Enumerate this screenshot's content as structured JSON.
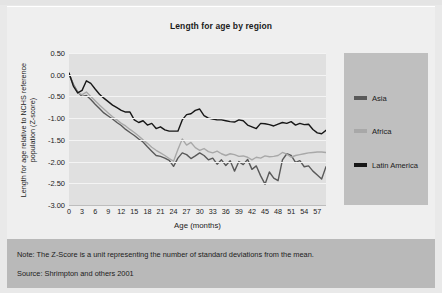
{
  "figure": {
    "title": "Length for age by region",
    "note": "Note: The Z-Score is a unit representing the number of standard deviations from the mean.",
    "source": "Source: Shrimpton and others 2001"
  },
  "colors": {
    "asia": "#595959",
    "africa": "#a8a8a8",
    "latin_america": "#171717",
    "plot_background": "#e0e0e0",
    "panel_background": "#efefef",
    "legend_background": "#bfbfbf",
    "footer_background": "#b9b9b9",
    "gridline": "#f4f4f4"
  },
  "legend": {
    "items": [
      {
        "label": "Asia",
        "color": "#595959"
      },
      {
        "label": "Africa",
        "color": "#a8a8a8"
      },
      {
        "label": "Latin America",
        "color": "#171717"
      }
    ]
  },
  "chart_data": {
    "type": "line",
    "title": "Length for age by region",
    "xlabel": "Age (months)",
    "ylabel": "Length for age relative to NCHS reference population (Z-score)",
    "xlim": [
      0,
      59
    ],
    "ylim": [
      -3.0,
      0.5
    ],
    "grid": true,
    "legend_position": "right",
    "xticks": [
      0,
      3,
      6,
      9,
      12,
      15,
      18,
      21,
      24,
      27,
      30,
      33,
      36,
      39,
      42,
      45,
      48,
      51,
      54,
      57
    ],
    "yticks": [
      0.5,
      0.0,
      -0.5,
      -1.0,
      -1.5,
      -2.0,
      -2.5,
      -3.0
    ],
    "ytick_labels": [
      "0.50",
      "0.00",
      "-0.50",
      "-1.00",
      "-1.50",
      "-2.00",
      "-2.50",
      "-3.00"
    ],
    "x": [
      0,
      1,
      2,
      3,
      4,
      5,
      6,
      7,
      8,
      9,
      10,
      11,
      12,
      13,
      14,
      15,
      16,
      17,
      18,
      19,
      20,
      21,
      22,
      23,
      24,
      25,
      26,
      27,
      28,
      29,
      30,
      31,
      32,
      33,
      34,
      35,
      36,
      37,
      38,
      39,
      40,
      41,
      42,
      43,
      44,
      45,
      46,
      47,
      48,
      49,
      50,
      51,
      52,
      53,
      54,
      55,
      56,
      57,
      58,
      59
    ],
    "series": [
      {
        "name": "Asia",
        "color": "#595959",
        "values": [
          0.02,
          -0.22,
          -0.4,
          -0.5,
          -0.48,
          -0.57,
          -0.68,
          -0.78,
          -0.88,
          -0.95,
          -1.02,
          -1.1,
          -1.17,
          -1.26,
          -1.33,
          -1.4,
          -1.48,
          -1.55,
          -1.66,
          -1.76,
          -1.86,
          -1.88,
          -1.92,
          -1.97,
          -2.11,
          -1.92,
          -1.8,
          -1.84,
          -1.93,
          -1.87,
          -1.8,
          -1.86,
          -1.96,
          -1.92,
          -2.06,
          -1.96,
          -2.09,
          -1.98,
          -2.22,
          -2.0,
          -2.07,
          -1.95,
          -2.18,
          -2.1,
          -2.33,
          -2.52,
          -2.24,
          -2.38,
          -2.44,
          -1.96,
          -1.82,
          -1.86,
          -2.02,
          -1.98,
          -2.12,
          -2.1,
          -2.22,
          -2.31,
          -2.4,
          -2.12
        ]
      },
      {
        "name": "Africa",
        "color": "#a8a8a8",
        "values": [
          0.02,
          -0.24,
          -0.42,
          -0.46,
          -0.4,
          -0.5,
          -0.6,
          -0.7,
          -0.79,
          -0.88,
          -0.97,
          -1.04,
          -1.12,
          -1.18,
          -1.26,
          -1.33,
          -1.41,
          -1.5,
          -1.58,
          -1.67,
          -1.74,
          -1.8,
          -1.86,
          -1.93,
          -1.99,
          -1.72,
          -1.48,
          -1.62,
          -1.56,
          -1.68,
          -1.74,
          -1.7,
          -1.77,
          -1.8,
          -1.76,
          -1.82,
          -1.86,
          -1.82,
          -1.84,
          -1.88,
          -1.87,
          -1.9,
          -1.96,
          -1.9,
          -1.92,
          -1.87,
          -1.89,
          -1.88,
          -1.86,
          -1.79,
          -1.83,
          -1.9,
          -1.86,
          -1.84,
          -1.82,
          -1.8,
          -1.79,
          -1.78,
          -1.78,
          -1.79
        ]
      },
      {
        "name": "Latin America",
        "color": "#171717",
        "values": [
          0.04,
          -0.26,
          -0.42,
          -0.36,
          -0.14,
          -0.2,
          -0.33,
          -0.45,
          -0.54,
          -0.62,
          -0.7,
          -0.76,
          -0.82,
          -0.86,
          -0.86,
          -1.04,
          -1.1,
          -1.06,
          -1.16,
          -1.12,
          -1.24,
          -1.2,
          -1.27,
          -1.3,
          -1.3,
          -1.3,
          -1.04,
          -0.92,
          -0.9,
          -0.82,
          -0.79,
          -0.94,
          -1.0,
          -1.02,
          -1.04,
          -1.04,
          -1.06,
          -1.08,
          -1.09,
          -1.04,
          -1.06,
          -1.16,
          -1.2,
          -1.24,
          -1.12,
          -1.13,
          -1.15,
          -1.18,
          -1.14,
          -1.1,
          -1.12,
          -1.08,
          -1.16,
          -1.12,
          -1.15,
          -1.14,
          -1.26,
          -1.34,
          -1.36,
          -1.28
        ]
      }
    ]
  }
}
